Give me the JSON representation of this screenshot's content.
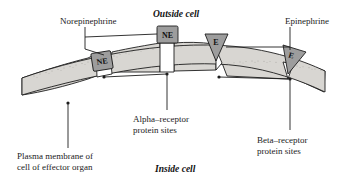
{
  "figure": {
    "title_outside": "Outside cell",
    "title_inside": "Inside cell",
    "background_color": "#ffffff",
    "membrane_fill": "#d8d6d2",
    "membrane_stroke": "#1d1d1d",
    "ligand_fill": "#9d9d9d",
    "socket_fill": "#ffffff",
    "line_color": "#1d1d1d"
  },
  "labels": {
    "norepinephrine": "Norepinephrine",
    "epinephrine": "Epinephrine",
    "alpha_receptor_line1": "Alpha–receptor",
    "alpha_receptor_line2": "protein sites",
    "beta_receptor_line1": "Beta–receptor",
    "beta_receptor_line2": "protein sites",
    "plasma_membrane_line1": "Plasma membrane of",
    "plasma_membrane_line2": "cell of effector organ"
  },
  "ligands": {
    "ne_chip_1": "NE",
    "ne_chip_2": "NE",
    "e_chip_1": "E",
    "e_chip_2": "E"
  }
}
